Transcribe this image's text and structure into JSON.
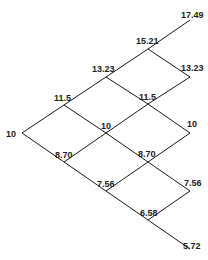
{
  "diagram": {
    "type": "binomial-tree",
    "steps": 4,
    "nodes": [
      {
        "id": "n00",
        "level": 0,
        "value": "10",
        "x": 22,
        "y": 133,
        "lx": 6,
        "ly": 137,
        "anchor": "start"
      },
      {
        "id": "n10",
        "level": 1,
        "value": "11.5",
        "x": 64,
        "y": 105,
        "lx": 54,
        "ly": 101,
        "anchor": "start"
      },
      {
        "id": "n11",
        "level": 1,
        "value": "8.70",
        "x": 64,
        "y": 162,
        "lx": 55,
        "ly": 158,
        "anchor": "start"
      },
      {
        "id": "n20",
        "level": 2,
        "value": "13.23",
        "x": 106,
        "y": 77,
        "lx": 92,
        "ly": 72,
        "anchor": "start"
      },
      {
        "id": "n21",
        "level": 2,
        "value": "10",
        "x": 106,
        "y": 133,
        "lx": 101,
        "ly": 129,
        "anchor": "start"
      },
      {
        "id": "n22",
        "level": 2,
        "value": "7.56",
        "x": 106,
        "y": 191,
        "lx": 97,
        "ly": 187,
        "anchor": "start"
      },
      {
        "id": "n30",
        "level": 3,
        "value": "15.21",
        "x": 148,
        "y": 49,
        "lx": 136,
        "ly": 44,
        "anchor": "start"
      },
      {
        "id": "n31",
        "level": 3,
        "value": "11.5",
        "x": 148,
        "y": 104,
        "lx": 139,
        "ly": 100,
        "anchor": "start"
      },
      {
        "id": "n32",
        "level": 3,
        "value": "8.70",
        "x": 148,
        "y": 162,
        "lx": 138,
        "ly": 157,
        "anchor": "start"
      },
      {
        "id": "n33",
        "level": 3,
        "value": "6.58",
        "x": 148,
        "y": 220,
        "lx": 140,
        "ly": 216,
        "anchor": "start"
      },
      {
        "id": "n40",
        "level": 4,
        "value": "17.49",
        "x": 190,
        "y": 20,
        "lx": 181,
        "ly": 18,
        "anchor": "start"
      },
      {
        "id": "n41",
        "level": 4,
        "value": "13.23",
        "x": 190,
        "y": 77,
        "lx": 181,
        "ly": 71,
        "anchor": "start"
      },
      {
        "id": "n42",
        "level": 4,
        "value": "10",
        "x": 190,
        "y": 133,
        "lx": 187,
        "ly": 127,
        "anchor": "start"
      },
      {
        "id": "n43",
        "level": 4,
        "value": "7.56",
        "x": 190,
        "y": 191,
        "lx": 184,
        "ly": 186,
        "anchor": "start"
      },
      {
        "id": "n44",
        "level": 4,
        "value": "5.72",
        "x": 190,
        "y": 249,
        "lx": 183,
        "ly": 249,
        "anchor": "start"
      }
    ],
    "edges": [
      [
        "n00",
        "n10"
      ],
      [
        "n00",
        "n11"
      ],
      [
        "n10",
        "n20"
      ],
      [
        "n10",
        "n21"
      ],
      [
        "n11",
        "n21"
      ],
      [
        "n11",
        "n22"
      ],
      [
        "n20",
        "n30"
      ],
      [
        "n20",
        "n31"
      ],
      [
        "n21",
        "n31"
      ],
      [
        "n21",
        "n32"
      ],
      [
        "n22",
        "n32"
      ],
      [
        "n22",
        "n33"
      ],
      [
        "n30",
        "n40"
      ],
      [
        "n30",
        "n41"
      ],
      [
        "n31",
        "n41"
      ],
      [
        "n31",
        "n42"
      ],
      [
        "n32",
        "n42"
      ],
      [
        "n32",
        "n43"
      ],
      [
        "n33",
        "n43"
      ],
      [
        "n33",
        "n44"
      ]
    ],
    "colors": {
      "line": "#1a1a1a",
      "text": "#222222",
      "background": "#ffffff"
    }
  }
}
